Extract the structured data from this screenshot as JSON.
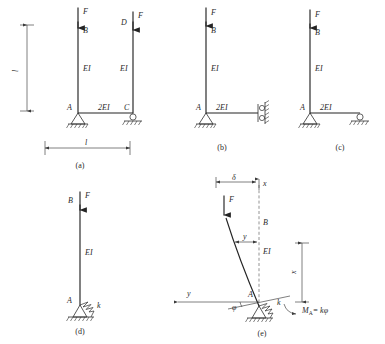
{
  "figure": {
    "ink_color": "#242424",
    "background_color": "#ffffff"
  },
  "panels": [
    {
      "id": "a",
      "caption": "(a)",
      "labels": {
        "load_left": "F",
        "load_right": "F",
        "node_b": "B",
        "node_d": "D",
        "node_a": "A",
        "node_c": "C",
        "stiffness_left_column": "EI",
        "stiffness_right_column": "EI",
        "stiffness_beam": "2EI",
        "height_dim": "l",
        "span_dim": "l"
      }
    },
    {
      "id": "b",
      "caption": "(b)",
      "labels": {
        "load": "F",
        "node_b": "B",
        "node_a": "A",
        "stiffness_column": "EI",
        "stiffness_beam": "2EI"
      }
    },
    {
      "id": "c",
      "caption": "(c)",
      "labels": {
        "load": "F",
        "node_b": "B",
        "node_a": "A",
        "stiffness_column": "EI",
        "stiffness_beam": "2EI"
      }
    },
    {
      "id": "d",
      "caption": "(d)",
      "labels": {
        "load": "F",
        "node_b": "B",
        "node_a": "A",
        "stiffness_column": "EI",
        "spring_constant": "k"
      }
    },
    {
      "id": "e",
      "caption": "(e)",
      "labels": {
        "load": "F",
        "node_b": "B",
        "node_a": "A",
        "stiffness_column": "EI",
        "axis_x": "x",
        "axis_y": "y",
        "deflection_tip": "δ",
        "deflection_y": "y",
        "coordinate_x": "x",
        "rotation_angle": "φ",
        "spring_constant": "k",
        "moment_symbol": "M",
        "moment_subscript": "A",
        "moment_equals": "= kφ"
      }
    }
  ]
}
